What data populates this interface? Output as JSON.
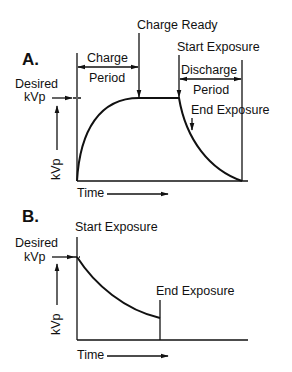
{
  "panel_a": {
    "letter": "A.",
    "charge_ready": "Charge Ready",
    "charge": "Charge",
    "period": "Period",
    "start_exposure": "Start Exposure",
    "discharge": "Discharge",
    "discharge_period": "Period",
    "end_exposure": "End Exposure",
    "desired": "Desired",
    "kvp_desired": "kVp",
    "y_axis": "kVp",
    "x_axis": "Time"
  },
  "panel_b": {
    "letter": "B.",
    "start_exposure": "Start Exposure",
    "end_exposure": "End Exposure",
    "desired": "Desired",
    "kvp_desired": "kVp",
    "y_axis": "kVp",
    "x_axis": "Time"
  },
  "colors": {
    "stroke": "#111111",
    "background": "#ffffff"
  }
}
